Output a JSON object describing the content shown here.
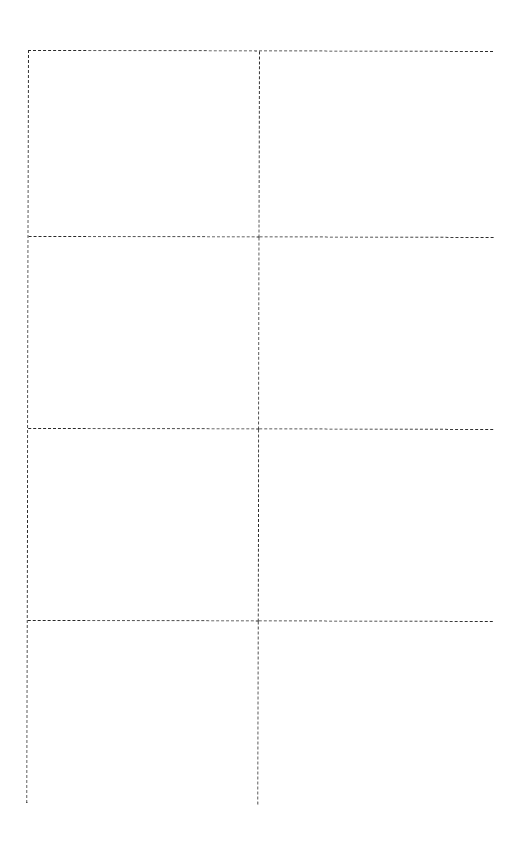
{
  "document": {
    "type": "card-template",
    "layout": {
      "columns": 2,
      "rows": 4,
      "line_style": "dashed",
      "line_color": "#2a2a2a",
      "background_color": "#ffffff"
    },
    "cells": [
      {
        "row": 1,
        "col": 1,
        "text": ""
      },
      {
        "row": 1,
        "col": 2,
        "text": ""
      },
      {
        "row": 2,
        "col": 1,
        "text": ""
      },
      {
        "row": 2,
        "col": 2,
        "text": ""
      },
      {
        "row": 3,
        "col": 1,
        "text": ""
      },
      {
        "row": 3,
        "col": 2,
        "text": ""
      },
      {
        "row": 4,
        "col": 1,
        "text": ""
      },
      {
        "row": 4,
        "col": 2,
        "text": ""
      }
    ]
  }
}
